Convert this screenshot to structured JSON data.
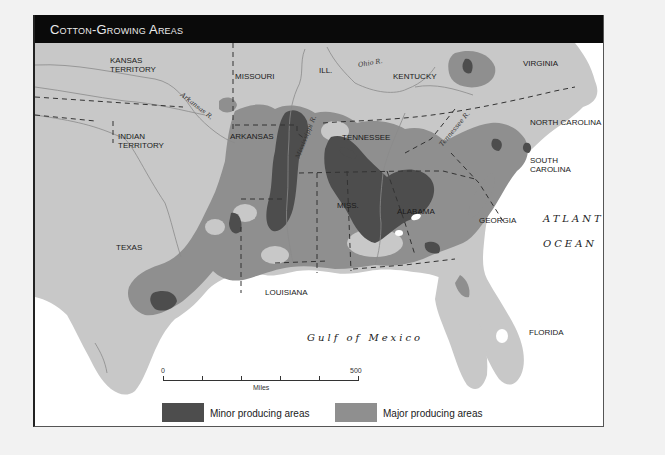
{
  "title": "Cotton-Growing Areas",
  "colors": {
    "land": "#c8c8c8",
    "water": "#ffffff",
    "major": "#8f8f8f",
    "minor": "#4d4d4d",
    "title_bar": "#0a0a0a",
    "boundary": "#333333",
    "river": "#8a8a8a"
  },
  "states": [
    {
      "name": "KANSAS",
      "name2": "TERRITORY"
    },
    {
      "name": "MISSOURI"
    },
    {
      "name": "ILL."
    },
    {
      "name": "KENTUCKY"
    },
    {
      "name": "VIRGINIA"
    },
    {
      "name": "INDIAN",
      "name2": "TERRITORY"
    },
    {
      "name": "ARKANSAS"
    },
    {
      "name": "TENNESSEE"
    },
    {
      "name": "NORTH CAROLINA"
    },
    {
      "name": "SOUTH",
      "name2": "CAROLINA"
    },
    {
      "name": "MISS."
    },
    {
      "name": "ALABAMA"
    },
    {
      "name": "GEORGIA"
    },
    {
      "name": "TEXAS"
    },
    {
      "name": "LOUISIANA"
    },
    {
      "name": "FLORIDA"
    }
  ],
  "rivers": [
    {
      "name": "Arkansas R."
    },
    {
      "name": "Ohio R."
    },
    {
      "name": "Mississippi R."
    },
    {
      "name": "Tennessee R."
    }
  ],
  "water_bodies": [
    {
      "name": "ATLANTIC"
    },
    {
      "name": "OCEAN"
    },
    {
      "name": "Gulf of Mexico"
    }
  ],
  "scale": {
    "start": "0",
    "end": "500",
    "unit": "Miles",
    "ticks": 6
  },
  "legend": [
    {
      "label": "Minor producing areas",
      "color": "#4d4d4d"
    },
    {
      "label": "Major producing areas",
      "color": "#8f8f8f"
    }
  ]
}
